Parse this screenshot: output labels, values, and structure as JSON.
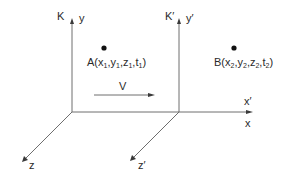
{
  "diagram": {
    "frame_K": {
      "label": "K",
      "axis_y_label": "y",
      "axis_z_label": "z"
    },
    "frame_K_prime": {
      "label": "K′",
      "axis_y_label": "y′",
      "axis_z_label": "z′"
    },
    "shared_x_axis": {
      "label_x_prime": "x′",
      "label_x": "x"
    },
    "velocity": {
      "label": "V"
    },
    "event_A": {
      "name": "A",
      "coords": [
        "x",
        "1",
        "y",
        "1",
        "z",
        "1",
        "t",
        "1"
      ]
    },
    "event_B": {
      "name": "B",
      "coords": [
        "x",
        "2",
        "y",
        "2",
        "z",
        "2",
        "t",
        "2"
      ]
    },
    "colors": {
      "axis": "#6e6e6e",
      "text": "#2a2a2a",
      "dot": "#111111"
    }
  }
}
